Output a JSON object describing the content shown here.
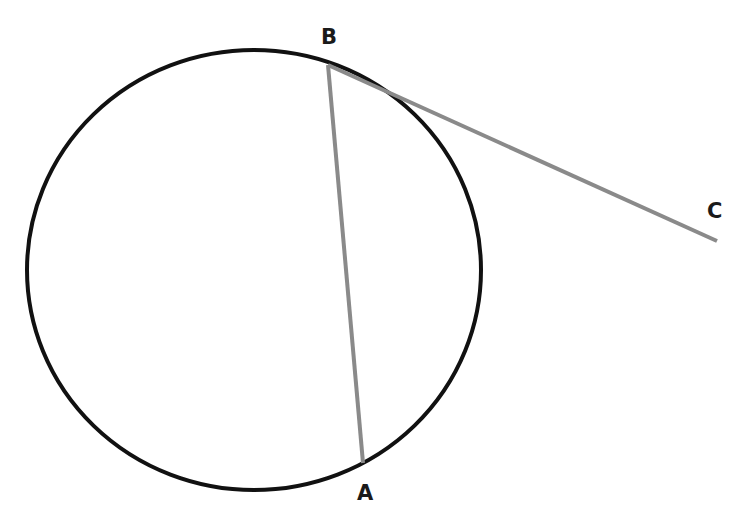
{
  "diagram": {
    "type": "circle with chord and tangent",
    "circle": {
      "cx": 254,
      "cy": 270,
      "rx": 227,
      "ry": 220,
      "stroke": "#111111"
    },
    "points": [
      {
        "name": "A",
        "x": 363,
        "y": 463,
        "label_x": 357,
        "label_y": 500
      },
      {
        "name": "B",
        "x": 328,
        "y": 65,
        "label_x": 321,
        "label_y": 44
      },
      {
        "name": "C",
        "x": 717,
        "y": 241,
        "label_x": 707,
        "label_y": 218
      }
    ],
    "segments": [
      {
        "from": "B",
        "to": "A",
        "kind": "chord",
        "color": "#8a8a8a"
      },
      {
        "from": "B",
        "to": "C",
        "kind": "tangent",
        "color": "#8a8a8a"
      }
    ]
  }
}
